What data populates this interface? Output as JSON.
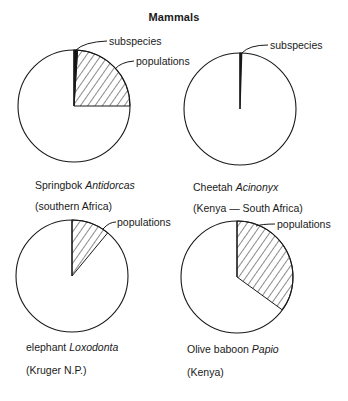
{
  "title": "Mammals",
  "colors": {
    "outline": "#1a1a1a",
    "subspecies": "#111111",
    "hatch": "#1a1a1a",
    "background": "#ffffff"
  },
  "chart_data": {
    "type": "pie",
    "title": "Mammals",
    "charts": [
      {
        "id": "springbok",
        "common_name": "Springbok",
        "genus": "Antidorcas",
        "region": "(southern Africa)",
        "slices": [
          {
            "label": "subspecies",
            "fraction": 0.01,
            "fill": "solid"
          },
          {
            "label": "populations",
            "fraction": 0.24,
            "fill": "hatched"
          },
          {
            "label": "",
            "fraction": 0.75,
            "fill": "none"
          }
        ]
      },
      {
        "id": "cheetah",
        "common_name": "Cheetah",
        "genus": "Acinonyx",
        "region": "(Kenya — South Africa)",
        "slices": [
          {
            "label": "subspecies",
            "fraction": 0.005,
            "fill": "solid"
          },
          {
            "label": "",
            "fraction": 0.995,
            "fill": "none"
          }
        ]
      },
      {
        "id": "elephant",
        "common_name": "elephant",
        "genus": "Loxodonta",
        "region": "(Kruger N.P.)",
        "slices": [
          {
            "label": "populations",
            "fraction": 0.11,
            "fill": "hatched"
          },
          {
            "label": "",
            "fraction": 0.89,
            "fill": "none"
          }
        ]
      },
      {
        "id": "baboon",
        "common_name": "Olive baboon",
        "genus": "Papio",
        "region": "(Kenya)",
        "slices": [
          {
            "label": "populations",
            "fraction": 0.35,
            "fill": "hatched"
          },
          {
            "label": "",
            "fraction": 0.65,
            "fill": "none"
          }
        ]
      }
    ],
    "layout": {
      "grid": "2x2",
      "legend": "callout labels",
      "start_angle": "12 o'clock, clockwise"
    }
  },
  "labels": {
    "springbok": {
      "common": "Springbok ",
      "genus": "Antidorcas",
      "region": "(southern Africa)",
      "callout_subspecies": "subspecies",
      "callout_populations": "populations"
    },
    "cheetah": {
      "common": "Cheetah ",
      "genus": "Acinonyx",
      "region": "(Kenya — South Africa)",
      "callout_subspecies": "subspecies"
    },
    "elephant": {
      "common": "elephant ",
      "genus": "Loxodonta",
      "region": "(Kruger N.P.)",
      "callout_populations": "populations"
    },
    "baboon": {
      "common": "Olive baboon ",
      "genus": "Papio",
      "region": "(Kenya)",
      "callout_populations": "populations"
    }
  }
}
